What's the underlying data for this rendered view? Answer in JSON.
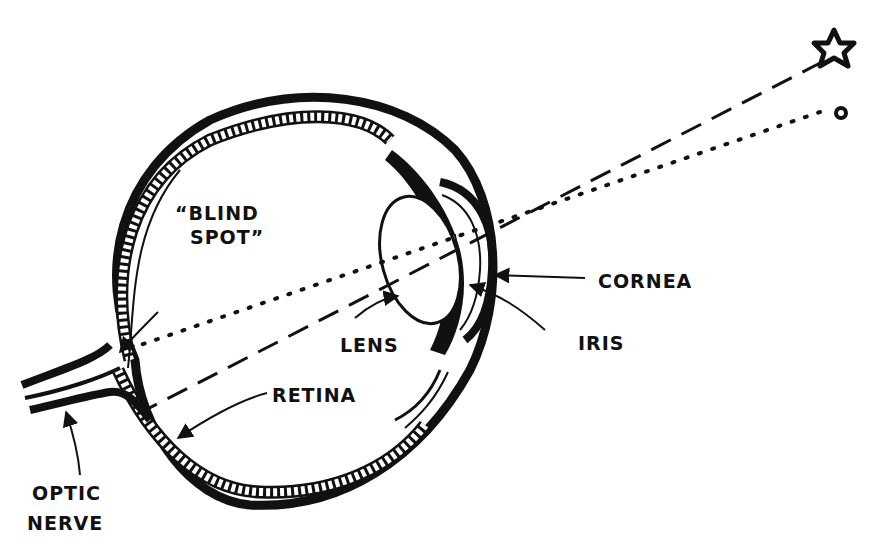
{
  "diagram": {
    "labels": {
      "blind_spot_line1": "“BLIND",
      "blind_spot_line2": "SPOT”",
      "cornea": "CORNEA",
      "iris": "IRIS",
      "lens": "LENS",
      "retina": "RETINA",
      "optic_line1": "OPTIC",
      "optic_line2": "NERVE"
    },
    "objects": {
      "star": "star-object",
      "circle": "circle-object"
    },
    "rays": {
      "star_ray": "dashed",
      "circle_ray": "dotted"
    },
    "colors": {
      "ink": "#111111",
      "paper": "#ffffff"
    }
  }
}
